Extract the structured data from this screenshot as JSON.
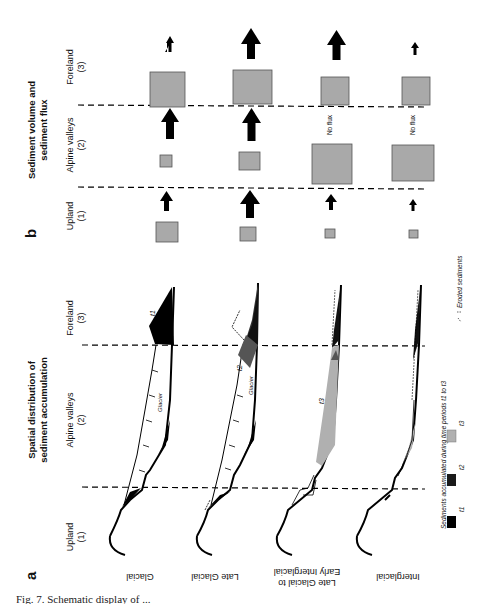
{
  "figure": {
    "caption_fragment": "Fig. 7. Schematic display of ...",
    "panel_a": {
      "letter": "a",
      "title_line1": "Spatial distribution of",
      "title_line2": "sediment accumulation",
      "zones": [
        {
          "name": "Upland",
          "num": "(1)"
        },
        {
          "name": "Alpine valleys",
          "num": "(2)"
        },
        {
          "name": "Foreland",
          "num": "(3)"
        }
      ],
      "periods": [
        {
          "label_line1": "Glacial",
          "label_line2": ""
        },
        {
          "label_line1": "Late Glacial",
          "label_line2": ""
        },
        {
          "label_line1": "Late Glacial to",
          "label_line2": "Early Interglacial"
        },
        {
          "label_line1": "Interglacial",
          "label_line2": ""
        }
      ],
      "annotations": {
        "glacier": "Glacier",
        "t1": "t1",
        "t2": "t2",
        "t3": "t3"
      },
      "legend": {
        "title": "Sediments accumulated during time periods t1 to t3",
        "items": [
          {
            "label": "t1",
            "color": "#000000"
          },
          {
            "label": "t2",
            "color": "#1a1a1a"
          },
          {
            "label": "t3",
            "color": "#b0b0b0"
          }
        ],
        "eroded_label": "Eroded sediments"
      }
    },
    "panel_b": {
      "letter": "b",
      "title_line1": "Sediment volume and",
      "title_line2": "sediment flux",
      "zones": [
        {
          "name": "Upland",
          "num": "(1)"
        },
        {
          "name": "Alpine valleys",
          "num": "(2)"
        },
        {
          "name": "Foreland",
          "num": "(3)"
        }
      ],
      "no_flux_label": "No flux",
      "rows": [
        {
          "period": "Glacial",
          "volume": {
            "upland": "medium",
            "alpine": "small",
            "foreland": "large"
          },
          "flux": {
            "upland_to_alpine": "medium",
            "alpine_to_foreland": "large",
            "foreland_out": "small"
          }
        },
        {
          "period": "Late Glacial",
          "volume": {
            "upland": "small",
            "alpine": "medium",
            "foreland": "large"
          },
          "flux": {
            "upland_to_alpine": "large",
            "alpine_to_foreland": "large",
            "foreland_out": "large"
          }
        },
        {
          "period": "Late Glacial to Early Interglacial",
          "volume": {
            "upland": "tiny",
            "alpine": "very large",
            "foreland": "medium"
          },
          "flux": {
            "upland_to_alpine": "medium",
            "alpine_to_foreland": "No flux",
            "foreland_out": "large"
          }
        },
        {
          "period": "Interglacial",
          "volume": {
            "upland": "tiny",
            "alpine": "very large",
            "foreland": "medium"
          },
          "flux": {
            "upland_to_alpine": "small",
            "alpine_to_foreland": "No flux",
            "foreland_out": "small"
          }
        }
      ]
    },
    "colors": {
      "sediment_box": "#a9a9a9",
      "box_border": "#555555",
      "t1": "#000000",
      "t2": "#2a2a2a",
      "t3": "#b0b0b0",
      "arrow": "#000000"
    }
  }
}
